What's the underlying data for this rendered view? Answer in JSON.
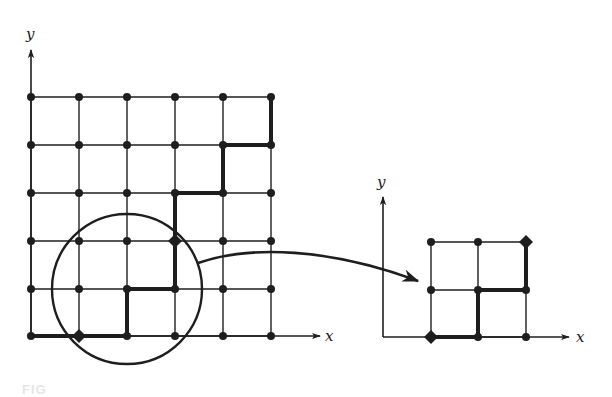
{
  "figure": {
    "colors": {
      "ink": "#1e1e1e",
      "background": "#ffffff"
    },
    "main_grid": {
      "x_axis_label": "x",
      "y_axis_label": "y",
      "xs": [
        31,
        79,
        127,
        175,
        223,
        271
      ],
      "ys": [
        97,
        145,
        193,
        241,
        289,
        336
      ],
      "path": [
        [
          0,
          0
        ],
        [
          1,
          0
        ],
        [
          2,
          0
        ],
        [
          2,
          1
        ],
        [
          3,
          1
        ],
        [
          3,
          3
        ],
        [
          4,
          3
        ],
        [
          4,
          4
        ],
        [
          5,
          4
        ],
        [
          5,
          5
        ]
      ],
      "highlight_diamonds": [
        [
          1,
          0
        ],
        [
          3,
          2
        ]
      ],
      "magnifier_circle": {
        "cx": 127,
        "cy": 289,
        "r": 75
      }
    },
    "zoomed_grid": {
      "x_axis_label": "y_placeholder_unused",
      "x_label": "x",
      "y_label": "y",
      "xs": [
        431,
        478,
        526
      ],
      "ys": [
        337,
        290,
        242
      ],
      "path": [
        [
          0,
          0
        ],
        [
          1,
          0
        ],
        [
          1,
          1
        ],
        [
          2,
          1
        ],
        [
          2,
          2
        ]
      ],
      "diamonds": [
        [
          0,
          0
        ],
        [
          2,
          2
        ]
      ]
    },
    "caption_fragment": "FIG"
  }
}
